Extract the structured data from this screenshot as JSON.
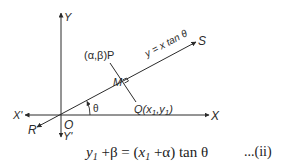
{
  "figure": {
    "axes": {
      "x_positive": "X",
      "x_negative": "X'",
      "y_positive": "Y",
      "y_negative": "Y'",
      "origin": "O"
    },
    "line": {
      "start_label": "R",
      "end_label": "S",
      "equation": "y = x tan θ"
    },
    "points": {
      "P": "(α,β)P",
      "M": "M",
      "Q_prefix": "Q(x",
      "Q_sub1": "1",
      "Q_mid": ",y",
      "Q_sub2": "1",
      "Q_suffix": ")"
    },
    "angle": "θ"
  },
  "equation": {
    "lhs_var": "y",
    "lhs_sub": "1",
    "lhs_rest": " +β = (",
    "rhs_var": "x",
    "rhs_sub": "1",
    "rhs_rest": " +α) tan θ",
    "number": "...(ii)"
  },
  "colors": {
    "ink": "#2b2b2b",
    "background": "#ffffff"
  }
}
